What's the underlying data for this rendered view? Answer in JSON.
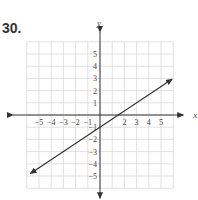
{
  "problem": {
    "number": "30."
  },
  "graph": {
    "x_axis_label": "x",
    "y_axis_label": "y",
    "x_ticks": [
      {
        "value": -5,
        "label": "−5"
      },
      {
        "value": -4,
        "label": "−4"
      },
      {
        "value": -3,
        "label": "−3"
      },
      {
        "value": -2,
        "label": "−2"
      },
      {
        "value": -1,
        "label": "−1"
      },
      {
        "value": 2,
        "label": "2"
      },
      {
        "value": 3,
        "label": "3"
      },
      {
        "value": 4,
        "label": "4"
      },
      {
        "value": 5,
        "label": "5"
      }
    ],
    "y_ticks": [
      {
        "value": 5,
        "label": "5"
      },
      {
        "value": 4,
        "label": "4"
      },
      {
        "value": 3,
        "label": "3"
      },
      {
        "value": 2,
        "label": "2"
      },
      {
        "value": 1,
        "label": "1"
      },
      {
        "value": -1,
        "label": "−1"
      },
      {
        "value": -2,
        "label": "−2"
      },
      {
        "value": -3,
        "label": "−3"
      },
      {
        "value": -4,
        "label": "−4"
      },
      {
        "value": -5,
        "label": "−5"
      }
    ],
    "grid_range": [
      -6,
      6
    ],
    "line": {
      "slope": 0.6667,
      "intercept": -1,
      "start": [
        -5.7,
        -4.8
      ],
      "end": [
        5.9,
        2.93
      ]
    },
    "colors": {
      "grid": "#d9d9d9",
      "axis": "#333333",
      "line": "#333333",
      "text": "#444444"
    }
  }
}
